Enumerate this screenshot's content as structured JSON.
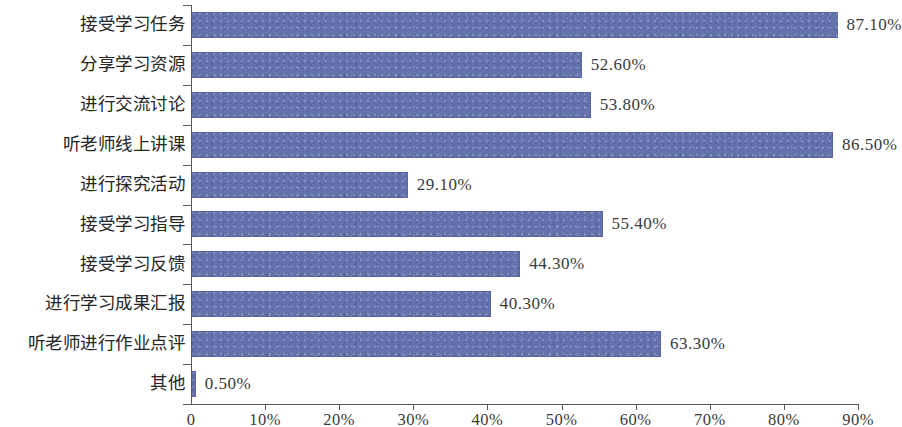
{
  "chart_data": {
    "type": "bar",
    "orientation": "horizontal",
    "title": "",
    "xlabel": "",
    "ylabel": "",
    "xlim": [
      0,
      90
    ],
    "xtick_labels": [
      "0",
      "10%",
      "20%",
      "30%",
      "40%",
      "50%",
      "60%",
      "70%",
      "80%",
      "90%"
    ],
    "xtick_values": [
      0,
      10,
      20,
      30,
      40,
      50,
      60,
      70,
      80,
      90
    ],
    "grid": false,
    "legend": "none",
    "bar_color": "#6472ad",
    "axis_color": "#5a5a5a",
    "categories": [
      "接受学习任务",
      "分享学习资源",
      "进行交流讨论",
      "听老师线上讲课",
      "进行探究活动",
      "接受学习指导",
      "接受学习反馈",
      "进行学习成果汇报",
      "听老师进行作业点评",
      "其他"
    ],
    "values": [
      87.1,
      52.6,
      53.8,
      86.5,
      29.1,
      55.4,
      44.3,
      40.3,
      63.3,
      0.5
    ],
    "value_labels": [
      "87.10%",
      "52.60%",
      "53.80%",
      "86.50%",
      "29.10%",
      "55.40%",
      "44.30%",
      "40.30%",
      "63.30%",
      "0.50%"
    ]
  }
}
